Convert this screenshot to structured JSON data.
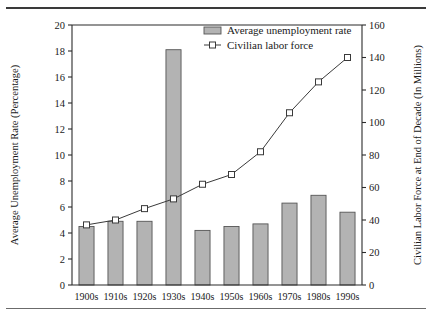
{
  "chart_data": {
    "type": "bar",
    "title": "",
    "categories": [
      "1900s",
      "1910s",
      "1920s",
      "1930s",
      "1940s",
      "1950s",
      "1960s",
      "1970s",
      "1980s",
      "1990s"
    ],
    "xlabel": "",
    "grid": false,
    "legend_position": "top-right",
    "series": [
      {
        "name": "Average unemployment rate",
        "type": "bar",
        "axis": "left",
        "values": [
          4.5,
          4.9,
          4.9,
          18.1,
          4.2,
          4.5,
          4.7,
          6.3,
          6.9,
          5.6
        ]
      },
      {
        "name": "Civilian labor force",
        "type": "line",
        "axis": "right",
        "values": [
          37,
          40,
          47,
          53,
          62,
          68,
          82,
          106,
          125,
          140
        ]
      }
    ],
    "left_axis": {
      "label": "Average Unemployment Rate (Percentage)",
      "min": 0,
      "max": 20,
      "step": 2,
      "ticks": [
        "0",
        "2",
        "4",
        "6",
        "8",
        "10",
        "12",
        "14",
        "16",
        "18",
        "20"
      ]
    },
    "right_axis": {
      "label": "Civilian Labor Force at End of Decade (In Millions)",
      "min": 0,
      "max": 160,
      "step": 20,
      "ticks": [
        "0",
        "20",
        "40",
        "60",
        "80",
        "100",
        "120",
        "140",
        "160"
      ]
    },
    "legend": [
      {
        "label": "Average unemployment rate",
        "marker": "filled-rectangle-swatch",
        "color": "#b3b3b3"
      },
      {
        "label": "Civilian labor force",
        "marker": "line-with-open-square",
        "color": "#3a3a3a"
      }
    ],
    "colors": {
      "bar_fill": "#b3b3b3",
      "bar_stroke": "#555555",
      "line": "#3a3a3a",
      "axis": "#2b2b2b",
      "background": "#ffffff"
    }
  }
}
